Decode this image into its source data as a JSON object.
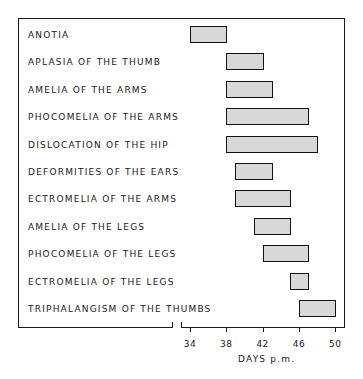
{
  "chart_data": {
    "type": "bar",
    "orientation": "horizontal-range",
    "title": "",
    "xlabel": "DAYS p.m.",
    "ylabel": "",
    "xlim": [
      34,
      50
    ],
    "x_ticks": [
      34,
      38,
      42,
      46,
      50
    ],
    "grid": false,
    "legend": null,
    "categories": [
      "ANOTIA",
      "APLASIA OF THE THUMB",
      "AMELIA OF THE ARMS",
      "PHOCOMELIA OF THE ARMS",
      "DISLOCATION OF THE HIP",
      "DEFORMITIES OF THE EARS",
      "ECTROMELIA OF THE ARMS",
      "AMELIA OF THE LEGS",
      "PHOCOMELIA OF THE LEGS",
      "ECTROMELIA OF THE LEGS",
      "TRIPHALANGISM OF THE THUMBS"
    ],
    "ranges": [
      {
        "start": 34,
        "end": 38
      },
      {
        "start": 38,
        "end": 42
      },
      {
        "start": 38,
        "end": 43
      },
      {
        "start": 38,
        "end": 47
      },
      {
        "start": 38,
        "end": 48
      },
      {
        "start": 39,
        "end": 43
      },
      {
        "start": 39,
        "end": 45
      },
      {
        "start": 41,
        "end": 45
      },
      {
        "start": 42,
        "end": 47
      },
      {
        "start": 45,
        "end": 47
      },
      {
        "start": 46,
        "end": 50
      }
    ],
    "axis_break": true
  },
  "axis": {
    "ticks": [
      "34",
      "38",
      "42",
      "46",
      "50"
    ],
    "label": "DAYS p.m."
  },
  "rows": [
    {
      "label": "ANOTIA"
    },
    {
      "label": "APLASIA OF THE THUMB"
    },
    {
      "label": "AMELIA OF THE ARMS"
    },
    {
      "label": "PHOCOMELIA OF THE ARMS"
    },
    {
      "label": "DISLOCATION OF THE HIP"
    },
    {
      "label": "DEFORMITIES OF THE EARS"
    },
    {
      "label": "ECTROMELIA OF THE ARMS"
    },
    {
      "label": "AMELIA OF THE LEGS"
    },
    {
      "label": "PHOCOMELIA OF THE LEGS"
    },
    {
      "label": "ECTROMELIA OF THE LEGS"
    },
    {
      "label": "TRIPHALANGISM OF THE THUMBS"
    }
  ],
  "colors": {
    "ink": "#1a1a1a",
    "bar_fill": "#d8d8d8"
  }
}
